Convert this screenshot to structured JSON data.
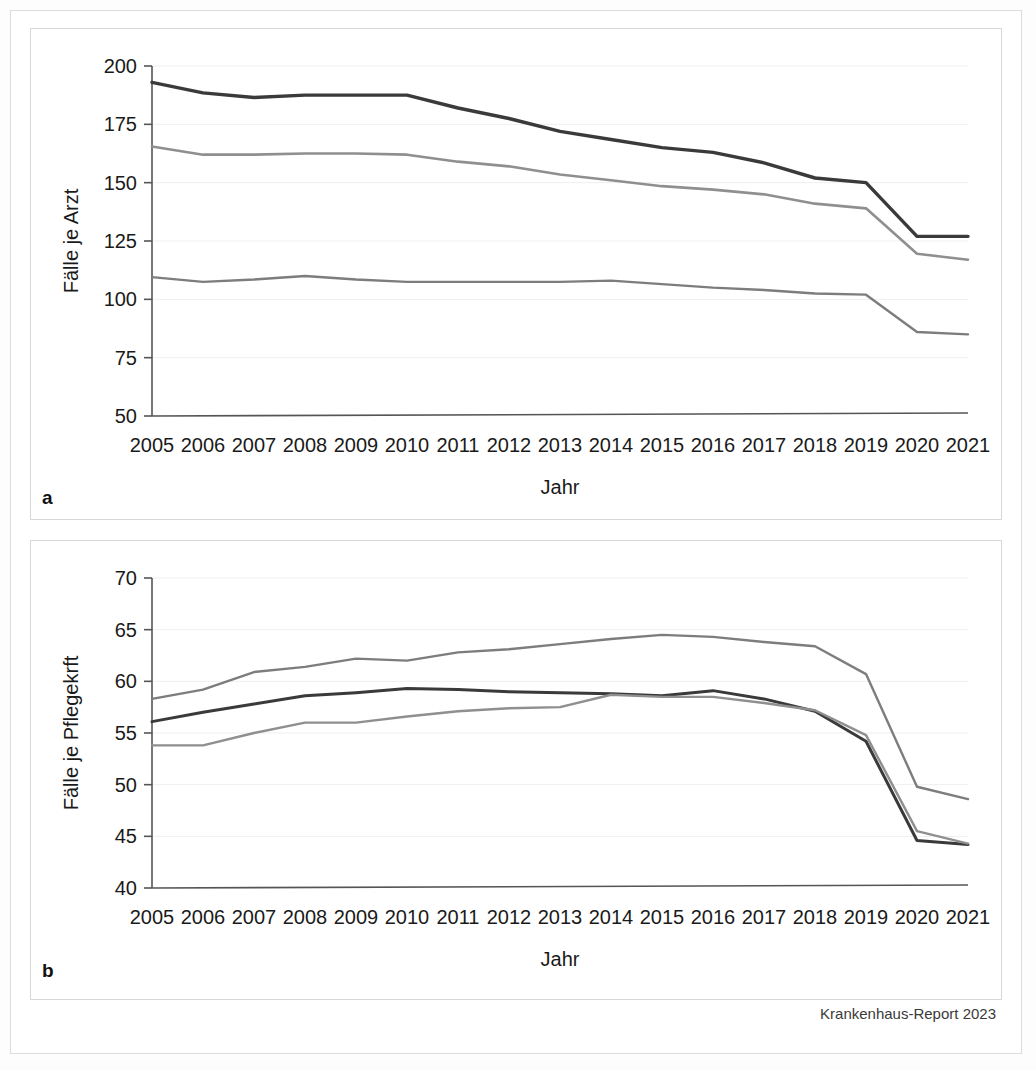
{
  "figure": {
    "credit": "Krankenhaus-Report 2023",
    "panels": [
      {
        "letter": "a"
      },
      {
        "letter": "b"
      }
    ]
  },
  "series_colors": {
    "unter_200": "#3a3a3a",
    "200_500": "#8f8f8f",
    "ueber_500": "#7d7d7d"
  },
  "chart_data": [
    {
      "id": "panel-a",
      "panel_letter": "a",
      "type": "line",
      "title": "",
      "xlabel": "Jahr",
      "ylabel": "Fälle je Arzt",
      "x": [
        2005,
        2006,
        2007,
        2008,
        2009,
        2010,
        2011,
        2012,
        2013,
        2014,
        2015,
        2016,
        2017,
        2018,
        2019,
        2020,
        2021
      ],
      "categories": [
        "2005",
        "2006",
        "2007",
        "2008",
        "2009",
        "2010",
        "2011",
        "2012",
        "2013",
        "2014",
        "2015",
        "2016",
        "2017",
        "2018",
        "2019",
        "2020",
        "2021"
      ],
      "ylim": [
        50,
        200
      ],
      "yticks": [
        50,
        75,
        100,
        125,
        150,
        175,
        200
      ],
      "ytick_labels": [
        "50",
        "75",
        "100",
        "125",
        "150",
        "175",
        "200"
      ],
      "grid": true,
      "legend_position": "bottom",
      "series": [
        {
          "name": "unter 200 Betten",
          "color": "#3a3a3a",
          "width": 3.4,
          "values": [
            193.0,
            188.5,
            186.5,
            187.5,
            187.5,
            187.5,
            182.0,
            177.5,
            172.0,
            168.5,
            165.0,
            163.0,
            158.5,
            152.0,
            150.0,
            127.0,
            127.0
          ]
        },
        {
          "name": "200-500 Betten",
          "color": "#8f8f8f",
          "width": 2.6,
          "values": [
            165.5,
            162.0,
            162.0,
            162.5,
            162.5,
            162.0,
            159.0,
            157.0,
            153.5,
            151.0,
            148.5,
            147.0,
            145.0,
            141.0,
            139.0,
            119.5,
            117.0
          ]
        },
        {
          "name": "über 500 Betten",
          "color": "#7d7d7d",
          "width": 2.4,
          "values": [
            109.5,
            107.5,
            108.5,
            110.0,
            108.5,
            107.5,
            107.5,
            107.5,
            107.5,
            108.0,
            106.5,
            105.0,
            104.0,
            102.5,
            102.0,
            86.0,
            85.0
          ]
        }
      ]
    },
    {
      "id": "panel-b",
      "panel_letter": "b",
      "type": "line",
      "title": "",
      "xlabel": "Jahr",
      "ylabel": "Fälle je Pflegekrft",
      "x": [
        2005,
        2006,
        2007,
        2008,
        2009,
        2010,
        2011,
        2012,
        2013,
        2014,
        2015,
        2016,
        2017,
        2018,
        2019,
        2020,
        2021
      ],
      "categories": [
        "2005",
        "2006",
        "2007",
        "2008",
        "2009",
        "2010",
        "2011",
        "2012",
        "2013",
        "2014",
        "2015",
        "2016",
        "2017",
        "2018",
        "2019",
        "2020",
        "2021"
      ],
      "ylim": [
        40,
        70
      ],
      "yticks": [
        40,
        45,
        50,
        55,
        60,
        65,
        70
      ],
      "ytick_labels": [
        "40",
        "45",
        "50",
        "55",
        "60",
        "65",
        "70"
      ],
      "grid": true,
      "legend_position": "bottom",
      "series": [
        {
          "name": "unter 200 Betten",
          "color": "#3a3a3a",
          "width": 3.0,
          "values": [
            56.1,
            57.0,
            57.8,
            58.6,
            58.9,
            59.3,
            59.2,
            59.0,
            58.9,
            58.8,
            58.6,
            59.1,
            58.3,
            57.1,
            54.2,
            44.6,
            44.2
          ]
        },
        {
          "name": "200-500 Betten",
          "color": "#8f8f8f",
          "width": 2.4,
          "values": [
            53.8,
            53.8,
            55.0,
            56.0,
            56.0,
            56.6,
            57.1,
            57.4,
            57.5,
            58.7,
            58.5,
            58.5,
            57.9,
            57.2,
            54.8,
            45.5,
            44.3
          ]
        },
        {
          "name": "über 500 Betten",
          "color": "#7d7d7d",
          "width": 2.4,
          "values": [
            58.3,
            59.2,
            60.9,
            61.4,
            62.2,
            62.0,
            62.8,
            63.1,
            63.6,
            64.1,
            64.5,
            64.3,
            63.8,
            63.4,
            60.7,
            49.8,
            48.6
          ]
        }
      ]
    }
  ]
}
